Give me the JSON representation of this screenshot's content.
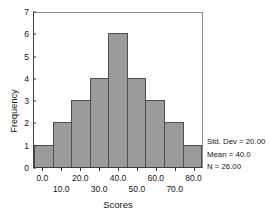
{
  "chart_data": {
    "type": "bar",
    "title": "",
    "xlabel": "Scores",
    "ylabel": "Frequency",
    "categories": [
      "0.0",
      "10.0",
      "20.0",
      "30.0",
      "40.0",
      "50.0",
      "60.0",
      "70.0",
      "80.0"
    ],
    "values": [
      1,
      2,
      3,
      4,
      6,
      4,
      3,
      2,
      1
    ],
    "bin_width": 10,
    "xlim": [
      -5,
      85
    ],
    "ylim": [
      0,
      7
    ],
    "y_ticks": [
      "7",
      "6",
      "5",
      "4",
      "3",
      "2",
      "1",
      "0"
    ],
    "y_tick_values": [
      7,
      6,
      5,
      4,
      3,
      2,
      1,
      0
    ],
    "x_ticks_top_row": [
      "0.0",
      "20.0",
      "40.0",
      "60.0",
      "80.0"
    ],
    "x_ticks_bottom_row": [
      "10.0",
      "30.0",
      "50.0",
      "70.0"
    ],
    "grid": false,
    "legend": "none",
    "bar_fill_color": "#9a9b9b",
    "bar_edge_color": "#4c4d4d",
    "background_color": "#ffffff",
    "frame_color": "#3d3d3d",
    "annotations": [
      "Std. Dev = 20.00",
      "Mean = 40.0",
      "N = 26.00"
    ]
  },
  "stats": {
    "std_dev_label": "Std. Dev = 20.00",
    "mean_label": "Mean = 40.0",
    "n_label": "N = 26.00"
  }
}
